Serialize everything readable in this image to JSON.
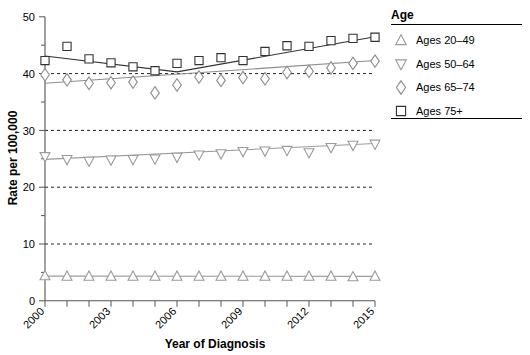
{
  "chart_data": {
    "type": "scatter",
    "title": "",
    "xlabel": "Year of Diagnosis",
    "ylabel": "Rate per 100,000",
    "x": [
      2000,
      2001,
      2002,
      2003,
      2004,
      2005,
      2006,
      2007,
      2008,
      2009,
      2010,
      2011,
      2012,
      2013,
      2014,
      2015
    ],
    "xlim": [
      2000,
      2015
    ],
    "ylim": [
      0,
      50
    ],
    "xticks": [
      2000,
      2001,
      2002,
      2003,
      2004,
      2005,
      2006,
      2007,
      2008,
      2009,
      2010,
      2011,
      2012,
      2013,
      2014,
      2015
    ],
    "xtick_labels": [
      "2000",
      "",
      "",
      "2003",
      "",
      "",
      "2006",
      "",
      "",
      "2009",
      "",
      "",
      "2012",
      "",
      "",
      "2015"
    ],
    "yticks": [
      0,
      10,
      20,
      30,
      40,
      50
    ],
    "ytick_labels": [
      "0",
      "10",
      "20",
      "30",
      "40",
      "50"
    ],
    "grid": "horizontal dashed at 10, 20, 30, 40",
    "gridlines_y": [
      10,
      20,
      30,
      40
    ],
    "legend_position": "right",
    "legend_title": "Age",
    "series": [
      {
        "name": "Ages 20–49",
        "marker": "triangle-up",
        "color": "#9a9a9a",
        "values": [
          4.4,
          4.3,
          4.3,
          4.3,
          4.3,
          4.3,
          4.3,
          4.3,
          4.3,
          4.3,
          4.3,
          4.3,
          4.3,
          4.3,
          4.2,
          4.3
        ],
        "trend": [
          4.35,
          4.3
        ]
      },
      {
        "name": "Ages 50–64",
        "marker": "triangle-down",
        "color": "#9a9a9a",
        "values": [
          25.4,
          24.9,
          24.6,
          24.8,
          24.9,
          25.0,
          25.3,
          25.7,
          25.9,
          26.3,
          26.4,
          26.5,
          26.1,
          27.0,
          27.4,
          27.6
        ],
        "trend": [
          24.9,
          27.7
        ]
      },
      {
        "name": "Ages 65–74",
        "marker": "diamond",
        "color": "#8c8c8c",
        "values": [
          39.8,
          38.9,
          38.3,
          38.4,
          38.5,
          36.6,
          38.0,
          39.4,
          38.8,
          39.3,
          39.1,
          40.2,
          40.4,
          41.0,
          41.8,
          42.2
        ],
        "trend": [
          38.3,
          42.3
        ]
      },
      {
        "name": "Ages 75+",
        "marker": "square",
        "color": "#333333",
        "values": [
          42.3,
          44.8,
          42.6,
          41.9,
          41.2,
          40.5,
          41.8,
          42.3,
          42.8,
          42.3,
          43.9,
          44.9,
          44.8,
          45.8,
          46.2,
          46.4
        ],
        "trend_segments": [
          {
            "x0": 2000,
            "y0": 43.1,
            "x1": 2006,
            "y1": 40.3
          },
          {
            "x0": 2006,
            "y0": 40.3,
            "x1": 2015,
            "y1": 46.5
          }
        ]
      }
    ]
  },
  "legend": {
    "title": "Age",
    "items": [
      {
        "label": "Ages 20–49",
        "marker": "triangle-up-icon"
      },
      {
        "label": "Ages 50–64",
        "marker": "triangle-down-icon"
      },
      {
        "label": "Ages 65–74",
        "marker": "diamond-icon"
      },
      {
        "label": "Ages 75+",
        "marker": "square-icon"
      }
    ]
  },
  "axes": {
    "x_title": "Year of Diagnosis",
    "y_title": "Rate per 100,000"
  }
}
